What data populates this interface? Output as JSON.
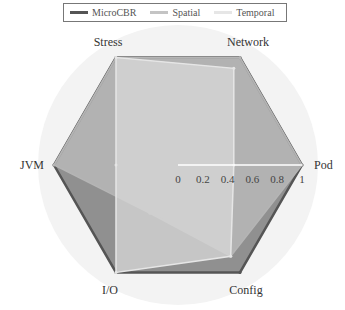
{
  "chart_data": {
    "type": "radar",
    "title": "",
    "axes": [
      "Pod",
      "Network",
      "Stress",
      "JVM",
      "I/O",
      "Config"
    ],
    "range": [
      0,
      1
    ],
    "ticks": [
      "0",
      "0.2",
      "0.4",
      "0.6",
      "0.8",
      "1"
    ],
    "legend_position": "top",
    "series": [
      {
        "name": "MicroCBR",
        "color": "#555555",
        "fill": "#8a8a8a",
        "values": [
          1.0,
          1.0,
          1.0,
          1.0,
          1.0,
          1.0
        ]
      },
      {
        "name": "Spatial",
        "color": "#b5b5b5",
        "fill": "#bdbdbd",
        "values": [
          1.0,
          1.0,
          1.0,
          1.0,
          0.45,
          0.85
        ]
      },
      {
        "name": "Temporal",
        "color": "#e6e6e6",
        "fill": "#d8d8d8",
        "values": [
          0.45,
          0.9,
          1.0,
          0.5,
          1.0,
          0.85
        ]
      }
    ]
  }
}
